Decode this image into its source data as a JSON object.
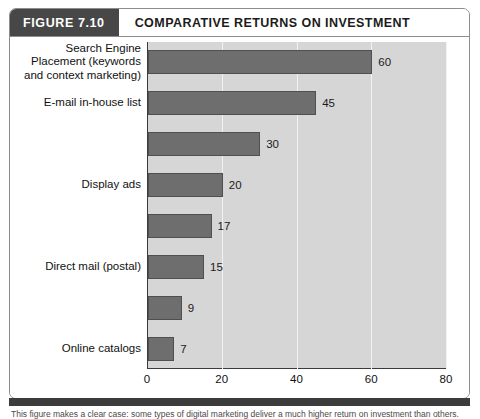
{
  "figure": {
    "tag": "FIGURE 7.10",
    "title": "COMPARATIVE RETURNS ON INVESTMENT",
    "caption": "This figure makes a clear case: some types of digital marketing deliver a much higher return on investment than others."
  },
  "chart_data": {
    "type": "bar",
    "orientation": "horizontal",
    "title": "COMPARATIVE RETURNS ON INVESTMENT",
    "xlabel": "",
    "ylabel": "",
    "xlim": [
      0,
      80
    ],
    "xticks": [
      "0",
      "20",
      "40",
      "60",
      "80"
    ],
    "grid": true,
    "legend": "none",
    "bar_color": "#6e6e6e",
    "plot_background": "#d6d6d6",
    "categories": [
      "Search Engine\nPlacement (keywords\nand context marketing)",
      "E-mail in-house list",
      "",
      "Display ads",
      "",
      "Direct mail (postal)",
      "",
      "Online catalogs"
    ],
    "values": [
      60,
      45,
      30,
      20,
      17,
      15,
      9,
      7
    ],
    "value_labels": [
      "60",
      "45",
      "30",
      "20",
      "17",
      "15",
      "9",
      "7"
    ]
  }
}
